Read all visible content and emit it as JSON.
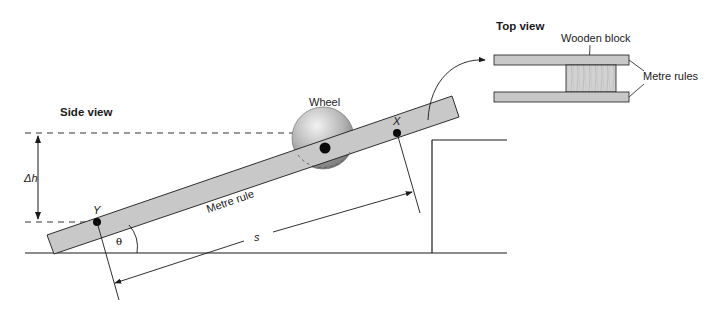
{
  "diagram": {
    "side_view": {
      "title": "Side view",
      "labels": {
        "wheel": "Wheel",
        "metre_rule": "Metre rule",
        "point_x": "X",
        "point_y": "Y",
        "delta_h": "Δh",
        "distance_s": "s",
        "angle": "θ"
      }
    },
    "top_view": {
      "title": "Top view",
      "labels": {
        "wooden_block": "Wooden block",
        "metre_rules": "Metre rules"
      }
    },
    "colors": {
      "rule_fill": "#c8c8c8",
      "block_fill": "#cfcfcf",
      "line": "#1a1a1a",
      "wheel_light": "#eeeeee",
      "wheel_dark": "#8a8a8a"
    }
  }
}
